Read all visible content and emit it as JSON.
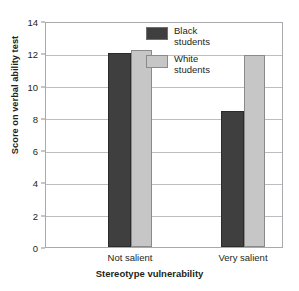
{
  "clipped_caption": "figure caption partially cut off at top edge",
  "chart_data": {
    "type": "bar",
    "title": "",
    "xlabel": "Stereotype vulnerability",
    "ylabel": "Score on verbal ability test",
    "categories": [
      "Not salient",
      "Very salient"
    ],
    "series": [
      {
        "name": "Black\nstudents",
        "color": "#3f3f3f",
        "values": [
          12.0,
          8.4
        ]
      },
      {
        "name": "White\nstudents",
        "color": "#c6c6c6",
        "values": [
          12.2,
          11.9
        ]
      }
    ],
    "ylim": [
      0,
      14
    ],
    "yticks": [
      0,
      2,
      4,
      6,
      8,
      10,
      12,
      14
    ],
    "ytick_labels": [
      "0",
      "2",
      "4",
      "6",
      "8",
      "10",
      "12",
      "14"
    ],
    "grid": true,
    "legend_position": "top-center"
  },
  "legend": {
    "items": [
      {
        "label": "Black\nstudents"
      },
      {
        "label": "White\nstudents"
      }
    ]
  }
}
